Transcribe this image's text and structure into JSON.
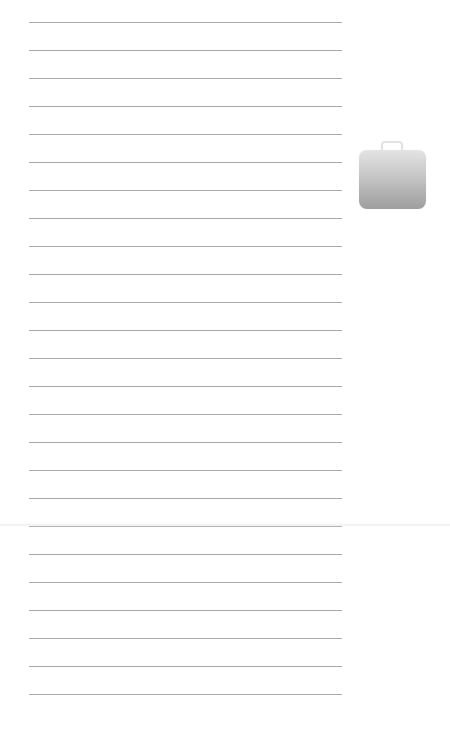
{
  "page": {
    "background": "#ffffff",
    "line_color": "#a9a9a9",
    "line_count": 25,
    "first_line_y": 22,
    "line_spacing": 28,
    "line_left": 29,
    "line_width": 313
  },
  "icons": {
    "bag": {
      "semantic": "briefcase-bag-icon",
      "gradient_top": "#e4e4e4",
      "gradient_bottom": "#9e9e9e"
    }
  }
}
